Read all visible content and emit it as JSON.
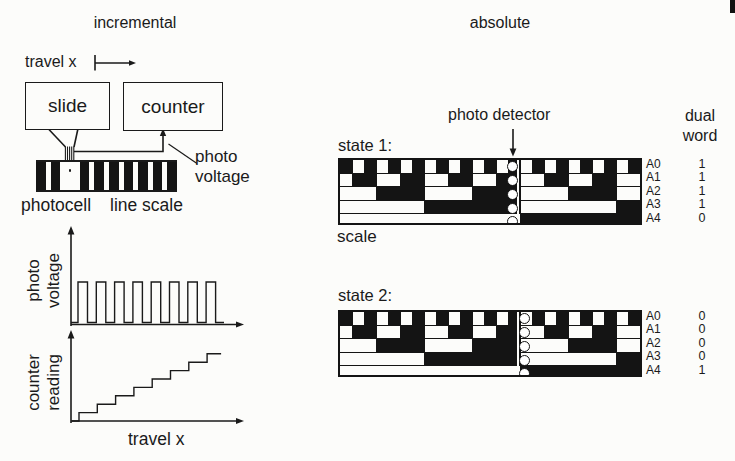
{
  "colors": {
    "ink": "#1a1a1a",
    "paper": "#fcfcfa"
  },
  "left": {
    "title": "incremental",
    "travel_top": "travel x",
    "slide_label": "slide",
    "counter_label": "counter",
    "photo_voltage_label": [
      "photo",
      "voltage"
    ],
    "photocell_label": "photocell",
    "line_scale_label": "line scale",
    "pv_axis_label": [
      "photo",
      "voltage"
    ],
    "pv_pulse_count": 8,
    "counter_axis_label": [
      "counter",
      "reading"
    ],
    "counter_step_count": 8,
    "travel_bottom": "travel x"
  },
  "right": {
    "title": "absolute",
    "photo_detector_label": "photo detector",
    "dual_word_label": [
      "dual",
      "word"
    ],
    "scale_caption": "scale",
    "tracks": [
      "A0",
      "A1",
      "A2",
      "A3",
      "A4"
    ],
    "patterns": [
      "10101010101010101010101010",
      "01100110011001100110011001",
      "00011110000111100001111000",
      "00000001111111100000000111",
      "00000000000000011111111111"
    ],
    "states": [
      {
        "label": "state 1:",
        "bits": [
          "1",
          "1",
          "1",
          "1",
          "0"
        ],
        "detector_side": "left"
      },
      {
        "label": "state 2:",
        "bits": [
          "0",
          "0",
          "0",
          "0",
          "1"
        ],
        "detector_side": "right"
      }
    ]
  }
}
